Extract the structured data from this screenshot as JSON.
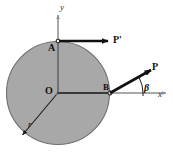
{
  "figure": {
    "kind": "free-body-diagram",
    "colors": {
      "disk_fill": "#a8a8a8",
      "disk_stroke": "#6f6f6f",
      "axis": "#8c8c8c",
      "force": "#111111",
      "text": "#111111",
      "caption": "#d8d8d8"
    },
    "axes": {
      "x_label": "x",
      "y_label": "y",
      "origin_label": "O"
    },
    "points": [
      {
        "name": "point-a",
        "label": "A",
        "x": 58,
        "y": 41
      },
      {
        "name": "point-o",
        "label": "O",
        "x": 58,
        "y": 93
      },
      {
        "name": "point-b",
        "label": "B",
        "x": 110,
        "y": 93
      }
    ],
    "disk": {
      "center_x": 58,
      "center_y": 93,
      "radius": 52,
      "radius_label": "r"
    },
    "forces": [
      {
        "name": "force-p-prime",
        "label": "P'",
        "applied_at": "A",
        "direction": "horizontal-right",
        "angle_deg": 0
      },
      {
        "name": "force-p",
        "label": "P",
        "applied_at": "B",
        "direction": "up-right",
        "angle_deg": 28
      }
    ],
    "angle_marks": [
      {
        "name": "angle-beta",
        "label": "β",
        "vertex": "B",
        "between": [
          "x-axis",
          "force-p"
        ],
        "value_deg": 28
      }
    ],
    "caption": ""
  }
}
